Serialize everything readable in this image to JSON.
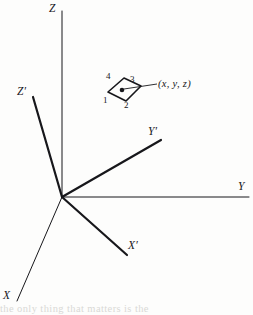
{
  "figure": {
    "type": "coordinate-axes-diagram",
    "background_color": "#fdfdfc",
    "ink_color": "#17171b",
    "width": 253,
    "height": 315,
    "origin": {
      "x": 62,
      "y": 197
    }
  },
  "axes": [
    {
      "key": "Z",
      "label": "Z",
      "frame": "unprimed",
      "stroke_width": 1.0,
      "label_x": 49,
      "label_y": 3,
      "x1": 62,
      "y1": 197,
      "x2": 62,
      "y2": 11
    },
    {
      "key": "Y",
      "label": "Y",
      "frame": "unprimed",
      "stroke_width": 1.0,
      "label_x": 238,
      "label_y": 181,
      "x1": 62,
      "y1": 197,
      "x2": 249,
      "y2": 197
    },
    {
      "key": "X",
      "label": "X",
      "frame": "unprimed",
      "stroke_width": 1.0,
      "label_x": 3,
      "label_y": 290,
      "x1": 62,
      "y1": 197,
      "x2": 17,
      "y2": 301
    },
    {
      "key": "Zp",
      "label": "Z′",
      "frame": "primed",
      "stroke_width": 2.2,
      "label_x": 17,
      "label_y": 86,
      "x1": 62,
      "y1": 197,
      "x2": 33,
      "y2": 97
    },
    {
      "key": "Yp",
      "label": "Y′",
      "frame": "primed",
      "stroke_width": 2.2,
      "label_x": 148,
      "label_y": 126,
      "x1": 62,
      "y1": 197,
      "x2": 161,
      "y2": 140
    },
    {
      "key": "Xp",
      "label": "X′",
      "frame": "primed",
      "stroke_width": 2.2,
      "label_x": 128,
      "label_y": 240,
      "x1": 62,
      "y1": 197,
      "x2": 127,
      "y2": 255
    }
  ],
  "element": {
    "name": "surface-element",
    "stroke_width": 1.6,
    "polygon": "108,92 124,78 141,86 126,101",
    "center_dot": {
      "x": 122,
      "y": 90,
      "r": 2.3
    },
    "leader": {
      "x1": 124,
      "y1": 89,
      "x2": 157,
      "y2": 84
    },
    "point_label": "(x, y, z)",
    "point_label_x": 158,
    "point_label_y": 79,
    "vertices": [
      {
        "label": "1",
        "x": 103,
        "y": 96
      },
      {
        "label": "2",
        "x": 124,
        "y": 101
      },
      {
        "label": "3",
        "x": 130,
        "y": 75
      },
      {
        "label": "4",
        "x": 106,
        "y": 72
      }
    ]
  },
  "page_bleed": {
    "line": "the only thing that matters is the",
    "top": 303
  }
}
